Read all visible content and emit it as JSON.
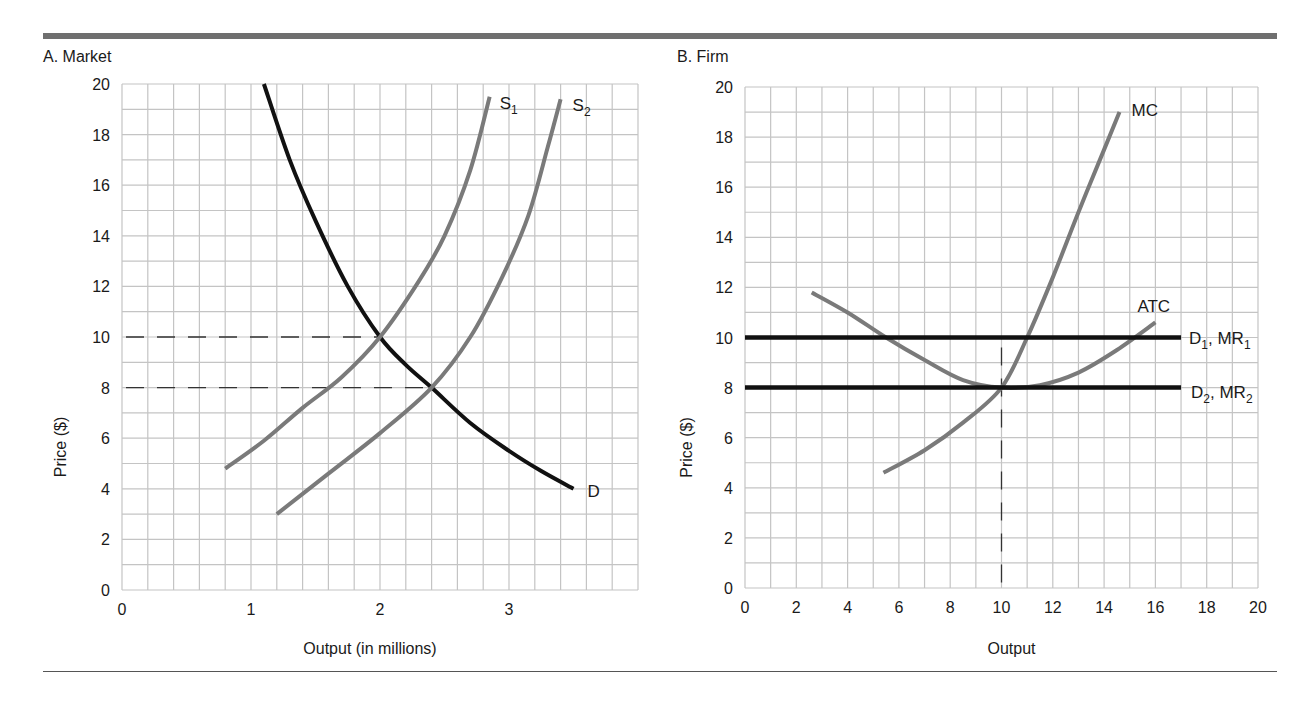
{
  "figure": {
    "panels": [
      {
        "id": "A",
        "title": "A. Market"
      },
      {
        "id": "B",
        "title": "B. Firm"
      }
    ]
  },
  "colors": {
    "grid": "#c4c4c4",
    "supply_curve": "#7a7a7a",
    "demand_curve": "#111111",
    "cost_curve": "#7a7a7a",
    "price_line": "#111111",
    "dashed": "#333333",
    "rule": "#6f6f6f"
  },
  "chart_data": [
    {
      "type": "line",
      "title": "A. Market",
      "xlabel": "Output (in millions)",
      "ylabel": "Price ($)",
      "xlim": [
        0,
        4
      ],
      "ylim": [
        0,
        20
      ],
      "xticks": [
        0,
        1,
        2,
        3
      ],
      "yticks": [
        0,
        2,
        4,
        6,
        8,
        10,
        12,
        14,
        16,
        18,
        20
      ],
      "grid": true,
      "grid_minor_x": 0.2,
      "grid_minor_y": 1,
      "series": [
        {
          "name": "D",
          "label": "D",
          "color": "#111111",
          "points": [
            [
              1.1,
              20
            ],
            [
              1.3,
              17
            ],
            [
              1.5,
              14.6
            ],
            [
              1.75,
              12
            ],
            [
              2.0,
              10
            ],
            [
              2.2,
              8.9
            ],
            [
              2.4,
              8
            ],
            [
              2.7,
              6.6
            ],
            [
              3.0,
              5.5
            ],
            [
              3.25,
              4.7
            ],
            [
              3.5,
              4
            ]
          ]
        },
        {
          "name": "S1",
          "label": "S",
          "subscript": "1",
          "color": "#7a7a7a",
          "points": [
            [
              0.8,
              4.8
            ],
            [
              1.1,
              5.9
            ],
            [
              1.4,
              7.2
            ],
            [
              1.7,
              8.4
            ],
            [
              2.0,
              10
            ],
            [
              2.3,
              12.2
            ],
            [
              2.5,
              14
            ],
            [
              2.7,
              16.6
            ],
            [
              2.85,
              19.5
            ]
          ]
        },
        {
          "name": "S2",
          "label": "S",
          "subscript": "2",
          "color": "#7a7a7a",
          "points": [
            [
              1.2,
              3
            ],
            [
              1.6,
              4.6
            ],
            [
              2.0,
              6.2
            ],
            [
              2.4,
              8
            ],
            [
              2.7,
              10
            ],
            [
              2.95,
              12.4
            ],
            [
              3.15,
              14.8
            ],
            [
              3.3,
              17.5
            ],
            [
              3.4,
              19.4
            ]
          ]
        }
      ],
      "reference_lines": [
        {
          "type": "horizontal_dashed",
          "y": 10,
          "x_from": 0,
          "x_to": 2.0
        },
        {
          "type": "horizontal_dashed",
          "y": 8,
          "x_from": 0,
          "x_to": 2.4
        }
      ],
      "equilibria": [
        {
          "curves": [
            "D",
            "S1"
          ],
          "x": 2,
          "y": 10
        },
        {
          "curves": [
            "D",
            "S2"
          ],
          "x": 2.4,
          "y": 8
        }
      ]
    },
    {
      "type": "line",
      "title": "B. Firm",
      "xlabel": "Output",
      "ylabel": "Price ($)",
      "xlim": [
        0,
        20
      ],
      "ylim": [
        0,
        20
      ],
      "xticks": [
        0,
        2,
        4,
        6,
        8,
        10,
        12,
        14,
        16,
        18,
        20
      ],
      "yticks": [
        0,
        2,
        4,
        6,
        8,
        10,
        12,
        14,
        16,
        18,
        20
      ],
      "grid": true,
      "grid_minor_x": 1,
      "grid_minor_y": 1,
      "series": [
        {
          "name": "MC",
          "label": "MC",
          "color": "#7a7a7a",
          "points": [
            [
              5.4,
              4.6
            ],
            [
              7,
              5.5
            ],
            [
              8.5,
              6.6
            ],
            [
              10,
              8
            ],
            [
              11,
              10
            ],
            [
              12,
              12.4
            ],
            [
              13,
              15
            ],
            [
              14,
              17.5
            ],
            [
              14.6,
              19
            ]
          ]
        },
        {
          "name": "ATC",
          "label": "ATC",
          "color": "#7a7a7a",
          "points": [
            [
              2.6,
              11.8
            ],
            [
              4,
              11
            ],
            [
              5.5,
              10
            ],
            [
              7,
              9.1
            ],
            [
              8.5,
              8.3
            ],
            [
              10,
              8
            ],
            [
              11.5,
              8.1
            ],
            [
              13,
              8.6
            ],
            [
              14.5,
              9.5
            ],
            [
              16,
              10.6
            ]
          ]
        },
        {
          "name": "D1, MR1",
          "label": "D",
          "subscript": "1",
          "label2": ", MR",
          "subscript2": "1",
          "color": "#111111",
          "points": [
            [
              0,
              10
            ],
            [
              17,
              10
            ]
          ]
        },
        {
          "name": "D2, MR2",
          "label": "D",
          "subscript": "2",
          "label2": ", MR",
          "subscript2": "2",
          "color": "#111111",
          "points": [
            [
              0,
              8
            ],
            [
              17,
              8
            ]
          ]
        }
      ],
      "reference_lines": [
        {
          "type": "vertical_dashed",
          "x": 10,
          "y_from": 0,
          "y_to": 9.6
        }
      ]
    }
  ]
}
